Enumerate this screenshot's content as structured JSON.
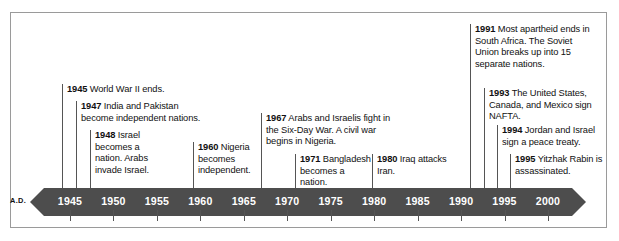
{
  "figure": {
    "era_label": "A.D.",
    "bar_color": "#4d4d4d",
    "border_color": "#9a9a9a",
    "text_color": "#111111"
  },
  "chart_data": {
    "type": "timeline",
    "title": "",
    "xlabel": "",
    "ylabel": "",
    "axis": {
      "era": "A.D.",
      "start": 1945,
      "end": 2000,
      "tick_step": 5,
      "tick_labels": [
        "1945",
        "1950",
        "1955",
        "1960",
        "1965",
        "1970",
        "1975",
        "1980",
        "1985",
        "1990",
        "1995",
        "2000"
      ],
      "tick_values": [
        1945,
        1950,
        1955,
        1960,
        1965,
        1970,
        1975,
        1980,
        1985,
        1990,
        1995,
        2000
      ],
      "arrow_left": true,
      "arrow_right": true,
      "grid": false
    },
    "events": [
      {
        "year": "1945",
        "text": "World War II ends."
      },
      {
        "year": "1947",
        "text": "India and Pakistan become independent nations."
      },
      {
        "year": "1948",
        "text": "Israel becomes a nation. Arabs invade Israel."
      },
      {
        "year": "1960",
        "text": "Nigeria becomes independent."
      },
      {
        "year": "1967",
        "text": "Arabs and Israelis fight in the Six-Day War. A civil war begins in Nigeria."
      },
      {
        "year": "1971",
        "text": "Bangladesh becomes a nation."
      },
      {
        "year": "1980",
        "text": "Iraq attacks Iran."
      },
      {
        "year": "1991",
        "text": "Most apartheid ends in South Africa. The Soviet Union breaks up into 15 separate nations."
      },
      {
        "year": "1993",
        "text": "The United States, Canada, and Mexico sign NAFTA."
      },
      {
        "year": "1994",
        "text": "Jordan and Israel sign a peace treaty."
      },
      {
        "year": "1995",
        "text": "Yitzhak Rabin is assassinated."
      }
    ]
  }
}
